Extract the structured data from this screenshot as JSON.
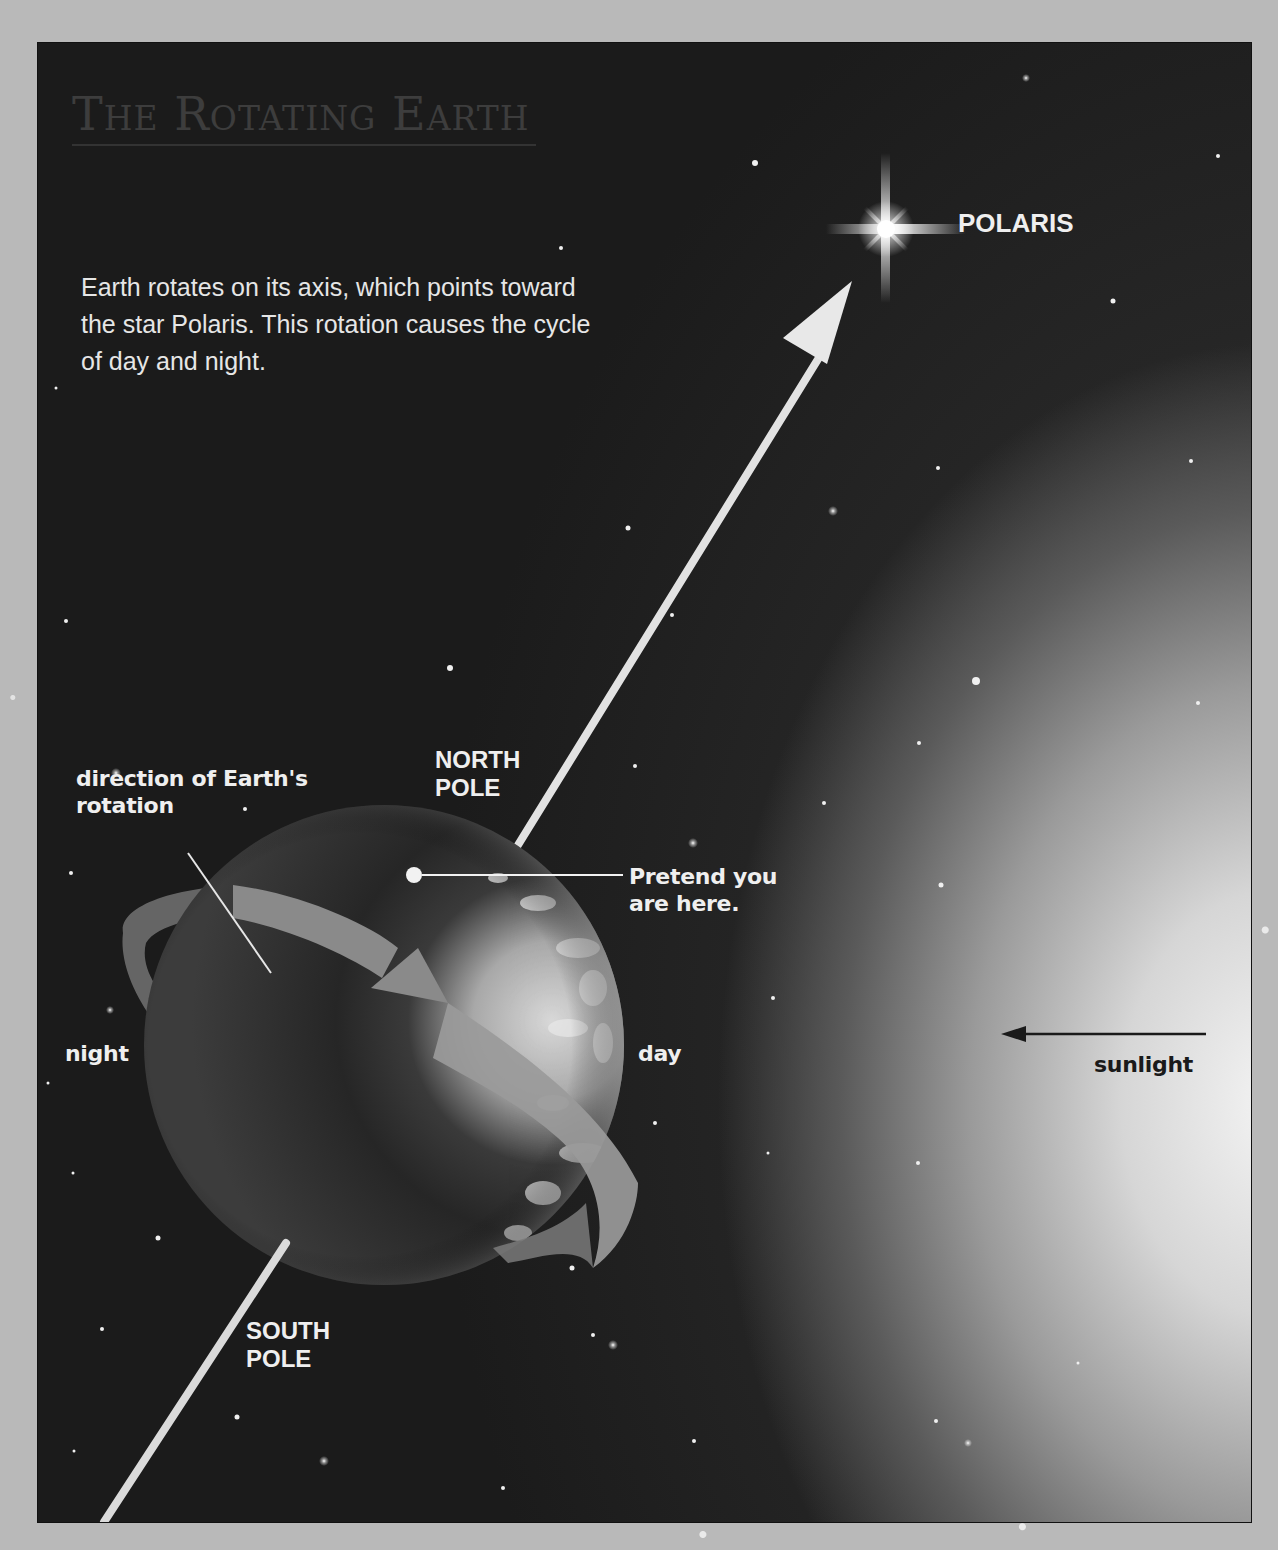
{
  "title": {
    "words": [
      {
        "initial": "T",
        "rest": "HE"
      },
      {
        "initial": "R",
        "rest": "OTATING"
      },
      {
        "initial": "E",
        "rest": "ARTH"
      }
    ],
    "full": "The Rotating Earth"
  },
  "caption": "Earth rotates on its axis, which points toward the star Polaris. This rotation causes the cycle of day and night.",
  "labels": {
    "polaris": "POLARIS",
    "north_pole_line1": "NORTH",
    "north_pole_line2": "POLE",
    "south_pole_line1": "SOUTH",
    "south_pole_line2": "POLE",
    "rotation_line1": "direction of Earth's",
    "rotation_line2": "rotation",
    "pretend_line1": "Pretend you",
    "pretend_line2": "are here.",
    "night": "night",
    "day": "day",
    "sunlight": "sunlight"
  },
  "icons": {
    "polaris": "four-point-star-flare",
    "axis_arrow": "arrow-up-right",
    "sunlight_arrow": "arrow-left",
    "rotation_arrow": "curved-ribbon-arrow",
    "location_marker": "dot-pin"
  },
  "colors": {
    "page_border": "#b9b9b9",
    "space": "#1b1b1b",
    "label_light": "#efefef",
    "label_dark": "#1a1a1a",
    "title": "#3d3d3d"
  }
}
